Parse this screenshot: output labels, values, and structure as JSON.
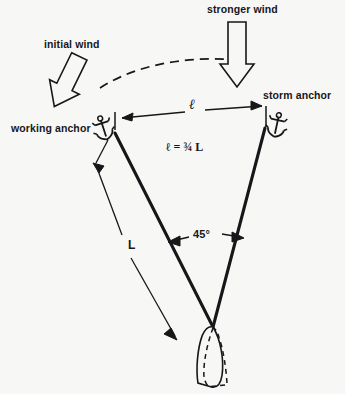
{
  "diagram": {
    "background_color": "#f7f7f6",
    "ink_color": "#17171a",
    "labels": {
      "stronger_wind": "stronger wind",
      "initial_wind": "initial wind",
      "working_anchor": "working anchor",
      "storm_anchor": "storm anchor",
      "ell_dimension": "ℓ",
      "equation": "ℓ = ¾ L",
      "angle": "45°",
      "rode_length": "L"
    },
    "values": {
      "angle_degrees": 45,
      "ell_ratio": "3/4",
      "ell_of_L": 0.75
    },
    "icons": {
      "working_anchor": "anchor-icon",
      "storm_anchor": "anchor-icon",
      "initial_wind": "block-arrow-icon",
      "stronger_wind": "block-arrow-icon",
      "wind_shift": "dashed-arc-icon",
      "boat_current": "boat-hull-icon",
      "boat_previous": "boat-hull-dashed-icon"
    }
  }
}
